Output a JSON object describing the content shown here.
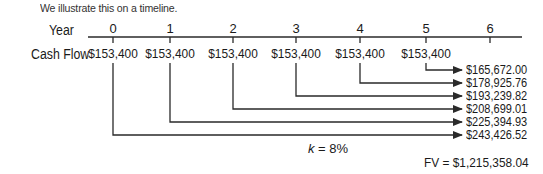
{
  "intro_text": "We illustrate this on a timeline.",
  "timeline": {
    "year_label": "Year",
    "cash_flow_label": "Cash Flow",
    "years": [
      "0",
      "1",
      "2",
      "3",
      "4",
      "5",
      "6"
    ],
    "cash_flows": [
      "$153,400",
      "$153,400",
      "$153,400",
      "$153,400",
      "$153,400",
      "$153,400"
    ]
  },
  "future_values": [
    {
      "from_year": "5",
      "value": "$165,672.00"
    },
    {
      "from_year": "4",
      "value": "$178,925.76"
    },
    {
      "from_year": "3",
      "value": "$193,239.82"
    },
    {
      "from_year": "2",
      "value": "$208,699.01"
    },
    {
      "from_year": "1",
      "value": "$225,394.93"
    },
    {
      "from_year": "0",
      "value": "$243,426.52"
    }
  ],
  "rate": {
    "k_symbol": "k",
    "k_value": " = 8%"
  },
  "total": {
    "label": "FV = $1,215,358.04"
  },
  "colors": {
    "line": "#2a2a2a",
    "text": "#1a1a1a"
  }
}
